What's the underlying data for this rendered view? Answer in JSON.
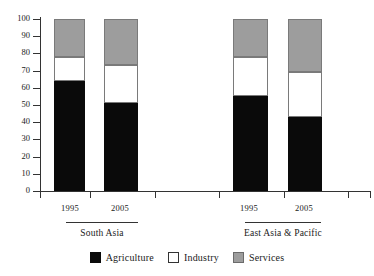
{
  "chart_data": {
    "type": "bar",
    "subtype": "stacked-bar-100-percent",
    "title": "",
    "xlabel": "",
    "ylabel": "",
    "ylim": [
      0,
      100
    ],
    "yticks": [
      0,
      10,
      20,
      30,
      40,
      50,
      60,
      70,
      80,
      90,
      100
    ],
    "grid": false,
    "legend_position": "bottom-center",
    "categories": [
      "1995",
      "2005",
      "1995",
      "2005"
    ],
    "groups": [
      {
        "label": "South Asia",
        "categories": [
          "1995",
          "2005"
        ]
      },
      {
        "label": "East Asia & Pacific",
        "categories": [
          "1995",
          "2005"
        ]
      }
    ],
    "series": [
      {
        "name": "Agriculture",
        "color": "#0a0a0a",
        "values": [
          64,
          51,
          55,
          43
        ]
      },
      {
        "name": "Industry",
        "color": "#ffffff",
        "values": [
          14,
          22,
          23,
          26
        ]
      },
      {
        "name": "Services",
        "color": "#9d9d9d",
        "values": [
          22,
          27,
          22,
          31
        ]
      }
    ],
    "bars": [
      {
        "group": "South Asia",
        "category": "1995",
        "segments": [
          {
            "name": "Agriculture",
            "value": 64,
            "bottom": 0,
            "top": 64
          },
          {
            "name": "Industry",
            "value": 14,
            "bottom": 64,
            "top": 78
          },
          {
            "name": "Services",
            "value": 22,
            "bottom": 78,
            "top": 100
          }
        ]
      },
      {
        "group": "South Asia",
        "category": "2005",
        "segments": [
          {
            "name": "Agriculture",
            "value": 51,
            "bottom": 0,
            "top": 51
          },
          {
            "name": "Industry",
            "value": 22,
            "bottom": 51,
            "top": 73
          },
          {
            "name": "Services",
            "value": 27,
            "bottom": 73,
            "top": 100
          }
        ]
      },
      {
        "group": "East Asia & Pacific",
        "category": "1995",
        "segments": [
          {
            "name": "Agriculture",
            "value": 55,
            "bottom": 0,
            "top": 55
          },
          {
            "name": "Industry",
            "value": 23,
            "bottom": 55,
            "top": 78
          },
          {
            "name": "Services",
            "value": 22,
            "bottom": 78,
            "top": 100
          }
        ]
      },
      {
        "group": "East Asia & Pacific",
        "category": "2005",
        "segments": [
          {
            "name": "Agriculture",
            "value": 43,
            "bottom": 0,
            "top": 43
          },
          {
            "name": "Industry",
            "value": 26,
            "bottom": 43,
            "top": 69
          },
          {
            "name": "Services",
            "value": 31,
            "bottom": 69,
            "top": 100
          }
        ]
      }
    ]
  },
  "axis": {
    "y_tick_labels": [
      "100",
      "90",
      "80",
      "70",
      "60",
      "50",
      "40",
      "30",
      "20",
      "10",
      "0"
    ]
  },
  "legend": {
    "items": [
      {
        "label": "Agriculture",
        "swatch": "agri"
      },
      {
        "label": "Industry",
        "swatch": "indu"
      },
      {
        "label": "Services",
        "swatch": "serv"
      }
    ]
  }
}
